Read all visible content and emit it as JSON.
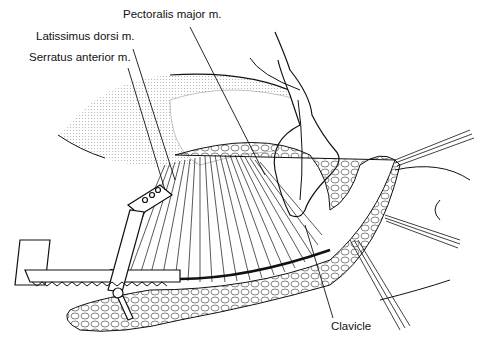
{
  "figure": {
    "type": "surgical-illustration",
    "labels": [
      {
        "id": "pectoralis",
        "text": "Pectoralis major m.",
        "x": 123,
        "y": 13
      },
      {
        "id": "latissimus",
        "text": "Latissimus dorsi m.",
        "x": 36,
        "y": 35
      },
      {
        "id": "serratus",
        "text": "Serratus anterior m.",
        "x": 29,
        "y": 56
      },
      {
        "id": "clavicle",
        "text": "Clavicle",
        "x": 331,
        "y": 322
      }
    ],
    "colors": {
      "ink": "#111111",
      "paper": "#ffffff",
      "stipple": "#9a9a9a"
    }
  }
}
